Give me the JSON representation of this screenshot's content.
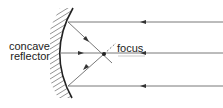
{
  "diagram": {
    "labels": {
      "reflector_line1": "concave",
      "reflector_line2": "reflector",
      "focus": "focus"
    },
    "colors": {
      "line": "#333333",
      "ray": "#555555",
      "hatch": "#666666",
      "background": "#ffffff"
    },
    "elements": {
      "mirror": "concave-mirror",
      "rays": [
        {
          "name": "top-ray",
          "y": 22,
          "direction": "leftward"
        },
        {
          "name": "middle-ray",
          "y": 53,
          "direction": "leftward"
        },
        {
          "name": "bottom-ray",
          "y": 86,
          "direction": "leftward"
        }
      ],
      "focus_point": {
        "x": 104,
        "y": 54
      }
    }
  }
}
